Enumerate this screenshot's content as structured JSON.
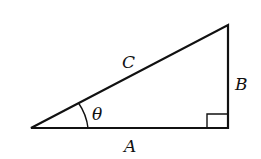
{
  "diagram": {
    "type": "right-triangle",
    "labels": {
      "hypotenuse": "C",
      "opposite": "B",
      "adjacent": "A",
      "angle": "θ"
    },
    "colors": {
      "stroke": "#111111",
      "background": "#ffffff"
    }
  }
}
